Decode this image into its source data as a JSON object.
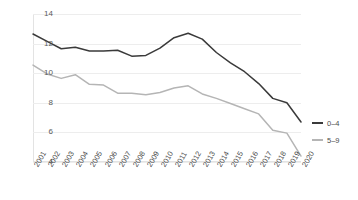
{
  "chart_data": {
    "type": "line",
    "title": "",
    "xlabel": "",
    "ylabel": "",
    "ylim": [
      4,
      14
    ],
    "yticks": [
      14,
      12,
      10,
      8,
      6,
      4
    ],
    "grid": true,
    "legend_position": "right",
    "categories": [
      "2001",
      "2002",
      "2003",
      "2004",
      "2005",
      "2006",
      "2007",
      "2008",
      "2009",
      "2010",
      "2011",
      "2012",
      "2013",
      "2014",
      "2015",
      "2016",
      "2017",
      "2018",
      "2019",
      "2020"
    ],
    "series": [
      {
        "name": "0–4",
        "color": "#3a3a3a",
        "values": [
          12.65,
          12.15,
          11.65,
          11.75,
          11.5,
          11.5,
          11.55,
          11.15,
          11.2,
          11.7,
          12.4,
          12.7,
          12.3,
          11.4,
          10.7,
          10.1,
          9.3,
          8.3,
          8.0,
          6.7
        ]
      },
      {
        "name": "5–9",
        "color": "#b5b5b5",
        "values": [
          10.55,
          9.95,
          9.65,
          9.9,
          9.25,
          9.2,
          8.65,
          8.65,
          8.55,
          8.7,
          9.0,
          9.15,
          8.6,
          8.3,
          7.95,
          7.6,
          7.25,
          6.15,
          5.95,
          4.4
        ]
      }
    ]
  },
  "legend": {
    "items": [
      {
        "label": "0–4",
        "color": "#3a3a3a"
      },
      {
        "label": "5–9",
        "color": "#b5b5b5"
      }
    ]
  },
  "axes": {
    "y_tick_labels": [
      "14",
      "12",
      "10",
      "8",
      "6",
      "4"
    ],
    "x_tick_labels": [
      "2001",
      "2002",
      "2003",
      "2004",
      "2005",
      "2006",
      "2007",
      "2008",
      "2009",
      "2010",
      "2011",
      "2012",
      "2013",
      "2014",
      "2015",
      "2016",
      "2017",
      "2018",
      "2019",
      "2020"
    ]
  }
}
